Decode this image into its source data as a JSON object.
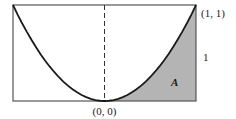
{
  "figure": {
    "type": "parabola-area-diagram",
    "curve": "y = x^2",
    "x_range": [
      -1,
      1
    ],
    "y_range": [
      0,
      1
    ],
    "labels": {
      "corner_point": "(1, 1)",
      "height": "1",
      "area": "A",
      "origin": "(0, 0)"
    },
    "shaded_region": "area under the curve from x=0 to x=1",
    "colors": {
      "stroke": "#1a1a1a",
      "frame": "#555555",
      "shade": "#b4b4b4",
      "background": "#ffffff"
    }
  }
}
